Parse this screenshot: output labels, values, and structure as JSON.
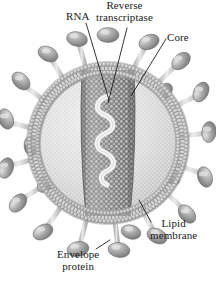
{
  "figure": {
    "kind": "retrovirus-cross-section",
    "background_color": "#ffffff"
  },
  "labels": {
    "rna": "RNA",
    "reverse_transcriptase_line1": "Reverse",
    "reverse_transcriptase_line2": "transcriptase",
    "core": "Core",
    "lipid_membrane_line1": "Lipid",
    "lipid_membrane_line2": "membrane",
    "envelope_protein_line1": "Envelope",
    "envelope_protein_line2": "protein"
  },
  "colors": {
    "ink": "#1a1a1a",
    "leader_line": "#111111",
    "envelope_protein_fill": "#9a9a9a",
    "envelope_protein_highlight": "#d8d8d8",
    "envelope_protein_edge": "#6d6d6d",
    "membrane_head": "#b4b4b4",
    "membrane_tail": "#9d9d9d",
    "interior_fill": "#d9d9d9",
    "interior_stipple": "#f2f2f2",
    "core_fill": "#8f8f8f",
    "core_stipple": "#dcdcdc",
    "rna_strand": "#efefef",
    "spike_stalk": "#cfcfcf"
  },
  "structures": {
    "envelope_proteins_count": 22,
    "membrane_layers": 2,
    "core_shape": "cylinder",
    "rna_shape": "serpentine-strand"
  },
  "geometry": {
    "virion_center_x": 108,
    "virion_center_y": 143,
    "outer_spike_radius": 103,
    "membrane_outer_radius": 81,
    "membrane_inner_radius": 68,
    "interior_radius": 67,
    "core_top_y": 70,
    "core_bottom_y": 216,
    "core_half_width_top": 26,
    "core_half_width_bottom": 22
  }
}
